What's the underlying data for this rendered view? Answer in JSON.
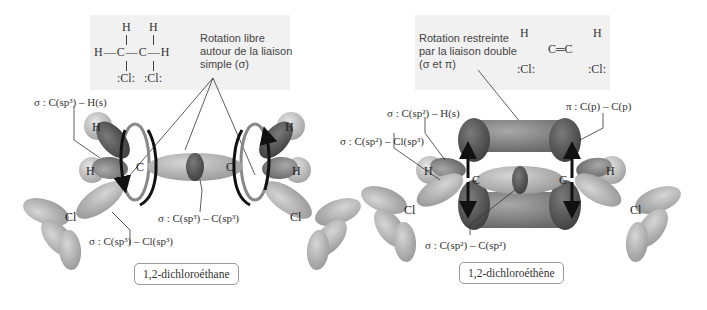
{
  "left_panel": {
    "structure": {
      "top_h1": "H",
      "top_h2": "H",
      "middle_row": "H—C—C—H",
      "bottom_cl1": ":Cl:",
      "bottom_cl2": ":Cl:"
    },
    "rotation_note": [
      "Rotation libre",
      "autour de la liaison",
      "simple (σ)"
    ],
    "labels": {
      "c_h": "σ : C(sp³) – H(s)",
      "c_c": "σ : C(sp³) – C(sp³)",
      "c_cl": "σ : C(sp³) – Cl(sp³)"
    },
    "atoms": {
      "h": "H",
      "c": "C",
      "cl": "Cl"
    },
    "caption": "1,2-dichloroéthane"
  },
  "right_panel": {
    "structure": {
      "h_left": "H",
      "h_right": "H",
      "double_bond": "C═C",
      "cl_left": ":Cl:",
      "cl_right": ":Cl:"
    },
    "rotation_note": [
      "Rotation restreinte",
      "par la liaison double",
      "(σ et π)"
    ],
    "labels": {
      "c_h": "σ : C(sp²) – H(s)",
      "c_cl": "σ : C(sp²) – Cl(sp³)",
      "pi": "π : C(p) – C(p)",
      "c_c": "σ : C(sp²) – C(sp²)"
    },
    "atoms": {
      "h": "H",
      "c": "C",
      "cl": "Cl"
    },
    "caption": "1,2-dichloroéthène"
  },
  "colors": {
    "note_box": "#f1f1f1",
    "lobe_light": "#b8b8b8",
    "lobe_mid": "#8a8a8a",
    "lobe_dark": "#555555",
    "arrow": "#111111"
  }
}
